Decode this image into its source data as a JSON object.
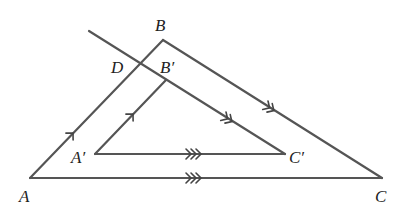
{
  "diagram": {
    "type": "geometry",
    "colors": {
      "stroke": "#555555",
      "label": "#222222",
      "background": "#ffffff"
    },
    "points": {
      "A": {
        "label": "A",
        "x": 30,
        "y": 178
      },
      "B": {
        "label": "B",
        "x": 163,
        "y": 40
      },
      "C": {
        "label": "C",
        "x": 382,
        "y": 178
      },
      "A'": {
        "label": "A′",
        "x": 95,
        "y": 154
      },
      "B'": {
        "label": "B′",
        "x": 166,
        "y": 80
      },
      "C'": {
        "label": "C′",
        "x": 285,
        "y": 154
      },
      "D": {
        "label": "D",
        "x": 142,
        "y": 63
      }
    },
    "labels": {
      "A": "A",
      "B": "B",
      "C": "C",
      "A_prime": "A′",
      "B_prime": "B′",
      "C_prime": "C′",
      "D": "D"
    },
    "segments": [
      {
        "name": "AB",
        "from": "A",
        "to": "B",
        "marker": "single-arrow"
      },
      {
        "name": "BC",
        "from": "B",
        "to": "C",
        "marker": "double-arrow"
      },
      {
        "name": "AC",
        "from": "A",
        "to": "C",
        "marker": "triple-arrow"
      },
      {
        "name": "A'B'",
        "from": "A'",
        "to": "B'",
        "marker": "single-arrow"
      },
      {
        "name": "A'C'",
        "from": "A'",
        "to": "C'",
        "marker": "triple-arrow"
      },
      {
        "name": "line-through-D-to-C'",
        "from": "(89,31)",
        "to": "C'",
        "marker": "double-arrow"
      }
    ],
    "parallel_relations": [
      "AB ∥ A'B' (single arrows)",
      "BC ∥ DC' (double arrows)",
      "AC ∥ A'C' (triple arrows)"
    ]
  }
}
